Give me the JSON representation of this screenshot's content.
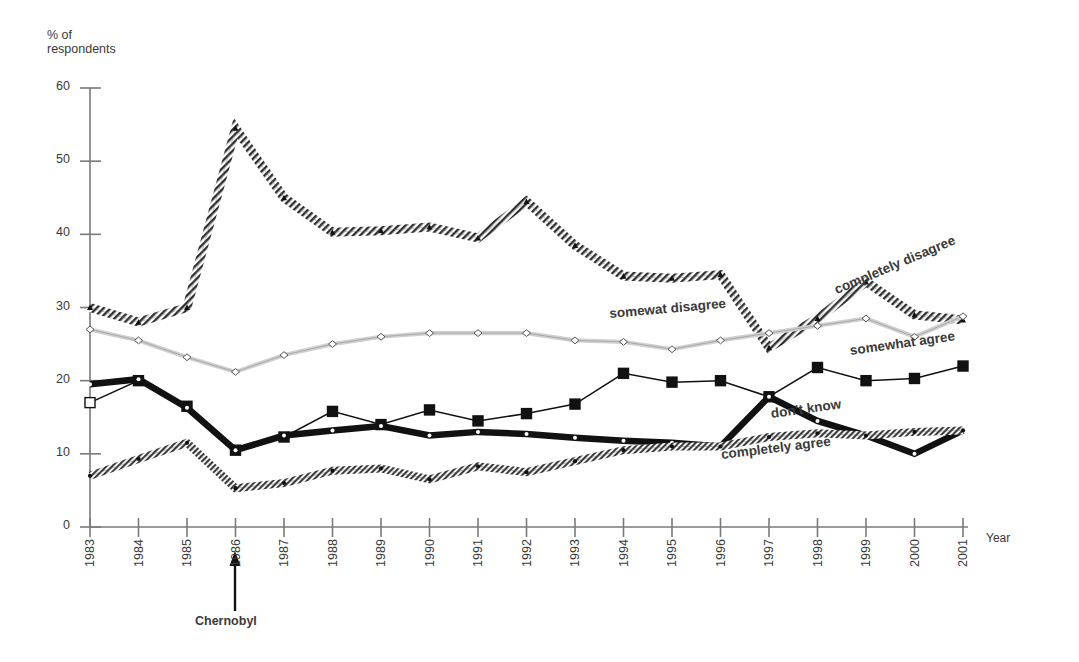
{
  "chart_data": {
    "type": "line",
    "title": "",
    "subtitle": "",
    "xlabel": "Year",
    "ylabel": "% of respondents",
    "ylabel_line1": "% of",
    "ylabel_line2": "respondents",
    "ylim": [
      0,
      60
    ],
    "xlim": [
      1983,
      2001
    ],
    "yticks": [
      0,
      10,
      20,
      30,
      40,
      50,
      60
    ],
    "grid": false,
    "legend_position": "inline-labels",
    "categories": [
      "1983",
      "1984",
      "1985",
      "1986",
      "1987",
      "1988",
      "1989",
      "1990",
      "1991",
      "1992",
      "1993",
      "1994",
      "1995",
      "1996",
      "1997",
      "1998",
      "1999",
      "2000",
      "2001"
    ],
    "series": [
      {
        "name": "completely disagree",
        "label": "completely disagree",
        "style": "hatched-thick-dark",
        "marker": "triangle",
        "color": "#4d4d4d",
        "values": [
          30.0,
          28.0,
          30.0,
          54.5,
          45.0,
          40.3,
          40.5,
          41.0,
          39.5,
          44.5,
          38.5,
          34.3,
          34.0,
          34.5,
          24.5,
          28.5,
          33.5,
          29.0,
          28.3
        ]
      },
      {
        "name": "somewhat disagree",
        "label": "somewat disagree",
        "style": "light-gray-thin",
        "marker": "diamond",
        "color": "#c9c9c9",
        "values": [
          27.0,
          25.5,
          23.2,
          21.2,
          23.5,
          25.0,
          26.0,
          26.5,
          26.5,
          26.5,
          25.5,
          25.3,
          24.3,
          25.5,
          26.5,
          27.5,
          28.5,
          26.0,
          28.8
        ]
      },
      {
        "name": "somewhat agree",
        "label": "somewhat agree",
        "style": "thin-black-squares",
        "marker": "filled-square",
        "color": "#111111",
        "values": [
          17.0,
          20.0,
          16.5,
          10.5,
          12.3,
          15.8,
          14.0,
          16.0,
          14.5,
          15.5,
          16.8,
          21.0,
          19.8,
          20.0,
          17.8,
          21.8,
          20.0,
          20.3,
          22.0
        ]
      },
      {
        "name": "don't know",
        "label": "don't know",
        "style": "thick-black",
        "marker": "dot",
        "color": "#111111",
        "values": [
          19.5,
          20.2,
          16.3,
          10.5,
          12.5,
          13.2,
          13.8,
          12.5,
          13.0,
          12.7,
          12.2,
          11.8,
          11.5,
          11.0,
          17.8,
          14.5,
          12.5,
          10.0,
          13.2
        ]
      },
      {
        "name": "completely agree",
        "label": "completely agree",
        "style": "hatched-dark",
        "marker": "dot",
        "color": "#555555",
        "values": [
          7.0,
          9.3,
          11.5,
          5.3,
          6.0,
          7.7,
          8.0,
          6.5,
          8.3,
          7.5,
          9.0,
          10.5,
          11.0,
          11.0,
          12.3,
          12.8,
          12.5,
          13.0,
          13.2
        ]
      }
    ],
    "annotations": [
      {
        "name": "chernobyl",
        "text": "Chernobyl",
        "at_category": "1986",
        "marker": "up-arrow"
      }
    ]
  },
  "axes": {
    "y_axis_name": "y-axis",
    "x_axis_name": "x-axis",
    "year_axis_caption": "Year"
  }
}
